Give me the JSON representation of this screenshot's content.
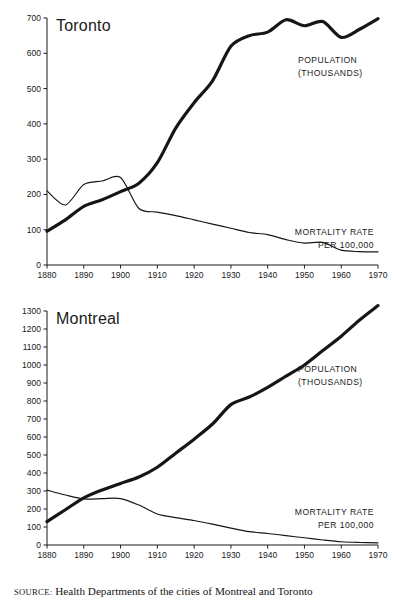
{
  "figure": {
    "source_keyword": "SOURCE:",
    "source_text": "Health Departments of the cities of Montreal and Toronto",
    "ink_color": "#161616",
    "background_color": "#ffffff"
  },
  "chart_data": [
    {
      "id": "toronto",
      "type": "line",
      "title": "Toronto",
      "xlabel": "",
      "ylabel": "",
      "xlim": [
        1880,
        1970
      ],
      "ylim": [
        0,
        700
      ],
      "grid": false,
      "legend_position": "inline-annotation",
      "xticks": [
        1880,
        1890,
        1900,
        1910,
        1920,
        1930,
        1940,
        1950,
        1960,
        1970
      ],
      "xtick_labels": [
        "1880",
        "1890",
        "1900",
        "1910",
        "1920",
        "1930",
        "1940",
        "1950",
        "1960",
        "1970"
      ],
      "yticks": [
        0,
        100,
        200,
        300,
        400,
        500,
        600,
        700
      ],
      "ytick_labels": [
        "0",
        "100",
        "200",
        "300",
        "400",
        "500",
        "600",
        "700"
      ],
      "series": [
        {
          "name": "POPULATION (THOUSANDS)",
          "label_line1": "POPULATION",
          "label_line2": "(THOUSANDS)",
          "style": "thick",
          "x": [
            1880,
            1885,
            1890,
            1895,
            1900,
            1905,
            1910,
            1915,
            1920,
            1925,
            1930,
            1935,
            1940,
            1945,
            1950,
            1955,
            1960,
            1965,
            1970
          ],
          "values": [
            96,
            128,
            166,
            185,
            208,
            232,
            290,
            388,
            460,
            522,
            620,
            650,
            660,
            695,
            678,
            690,
            645,
            668,
            698
          ]
        },
        {
          "name": "MORTALITY RATE PER 100,000",
          "label_line1": "MORTALITY RATE",
          "label_line2": "PER 100,000",
          "style": "thin",
          "x": [
            1880,
            1885,
            1890,
            1895,
            1900,
            1905,
            1910,
            1915,
            1920,
            1925,
            1930,
            1935,
            1940,
            1945,
            1950,
            1955,
            1960,
            1965,
            1970
          ],
          "values": [
            210,
            170,
            228,
            238,
            248,
            160,
            150,
            140,
            128,
            116,
            104,
            92,
            86,
            72,
            62,
            64,
            42,
            38,
            37
          ]
        }
      ]
    },
    {
      "id": "montreal",
      "type": "line",
      "title": "Montreal",
      "xlabel": "",
      "ylabel": "",
      "xlim": [
        1880,
        1970
      ],
      "ylim": [
        0,
        1300
      ],
      "grid": false,
      "legend_position": "inline-annotation",
      "xticks": [
        1880,
        1890,
        1900,
        1910,
        1920,
        1930,
        1940,
        1950,
        1960,
        1970
      ],
      "xtick_labels": [
        "1880",
        "1890",
        "1900",
        "1910",
        "1920",
        "1930",
        "1940",
        "1950",
        "1960",
        "1970"
      ],
      "yticks": [
        0,
        100,
        200,
        300,
        400,
        500,
        600,
        700,
        800,
        900,
        1000,
        1100,
        1200,
        1300
      ],
      "ytick_labels": [
        "0",
        "100",
        "200",
        "300",
        "400",
        "500",
        "600",
        "700",
        "800",
        "900",
        "1000",
        "1100",
        "1200",
        "1300"
      ],
      "series": [
        {
          "name": "POPULATION (THOUSANDS)",
          "label_line1": "POPULATION",
          "label_line2": "(THOUSANDS)",
          "style": "thick",
          "x": [
            1880,
            1885,
            1890,
            1895,
            1900,
            1905,
            1910,
            1915,
            1920,
            1925,
            1930,
            1935,
            1940,
            1945,
            1950,
            1955,
            1960,
            1965,
            1970
          ],
          "values": [
            130,
            196,
            262,
            306,
            342,
            378,
            432,
            510,
            588,
            672,
            780,
            822,
            876,
            938,
            1000,
            1080,
            1160,
            1250,
            1330
          ]
        },
        {
          "name": "MORTALITY RATE PER 100,000",
          "label_line1": "MORTALITY RATE",
          "label_line2": "PER 100,000",
          "style": "thin",
          "x": [
            1880,
            1885,
            1890,
            1895,
            1900,
            1905,
            1910,
            1915,
            1920,
            1925,
            1930,
            1935,
            1940,
            1945,
            1950,
            1955,
            1960,
            1965,
            1970
          ],
          "values": [
            305,
            278,
            256,
            258,
            258,
            222,
            172,
            152,
            136,
            116,
            94,
            74,
            64,
            52,
            40,
            28,
            18,
            14,
            12
          ]
        }
      ]
    }
  ]
}
